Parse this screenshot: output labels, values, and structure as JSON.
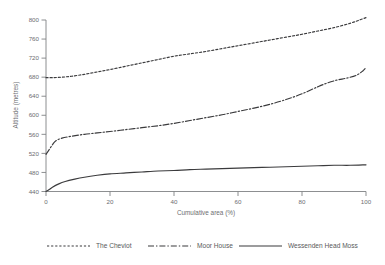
{
  "chart_data": {
    "type": "line",
    "title": "",
    "xlabel": "Cumulative area (%)",
    "ylabel": "Altitude (metres)",
    "xlim": [
      0,
      100
    ],
    "ylim": [
      440,
      800
    ],
    "xticks": [
      0,
      20,
      40,
      60,
      80,
      100
    ],
    "yticks": [
      440,
      480,
      520,
      560,
      600,
      640,
      680,
      720,
      760,
      800
    ],
    "grid": false,
    "legend_position": "below",
    "series": [
      {
        "name": "The Cheviot",
        "style": "dotted",
        "x": [
          0,
          2,
          5,
          8,
          12,
          16,
          20,
          25,
          30,
          35,
          40,
          45,
          50,
          55,
          60,
          65,
          70,
          75,
          80,
          85,
          90,
          95,
          98,
          100
        ],
        "values": [
          679,
          679,
          680,
          682,
          686,
          691,
          696,
          703,
          710,
          717,
          724,
          729,
          734,
          740,
          746,
          752,
          758,
          764,
          770,
          777,
          784,
          793,
          800,
          805
        ]
      },
      {
        "name": "Moor House",
        "style": "dash-dot",
        "x": [
          0,
          1,
          2,
          3,
          5,
          8,
          12,
          16,
          20,
          25,
          30,
          35,
          40,
          45,
          50,
          55,
          60,
          65,
          70,
          75,
          80,
          85,
          88,
          91,
          94,
          97,
          99,
          100
        ],
        "values": [
          518,
          528,
          538,
          546,
          552,
          556,
          560,
          563,
          566,
          570,
          574,
          578,
          583,
          589,
          595,
          601,
          608,
          615,
          623,
          633,
          645,
          660,
          668,
          674,
          678,
          684,
          693,
          700
        ]
      },
      {
        "name": "Wessenden Head Moss",
        "style": "solid",
        "x": [
          0,
          1,
          2,
          4,
          6,
          9,
          12,
          16,
          20,
          25,
          30,
          35,
          40,
          45,
          50,
          55,
          60,
          65,
          70,
          75,
          80,
          85,
          90,
          95,
          100
        ],
        "values": [
          440,
          444,
          449,
          456,
          461,
          466,
          470,
          474,
          477,
          479,
          481,
          483,
          484,
          486,
          487,
          488,
          489,
          490,
          491,
          492,
          493,
          494,
          495,
          495,
          496
        ]
      }
    ]
  },
  "axes": {
    "y_title": "Altitude (metres)",
    "x_title": "Cumulative area (%)",
    "y_tick_labels": [
      "800",
      "760",
      "720",
      "680",
      "640",
      "600",
      "560",
      "520",
      "480",
      "440"
    ],
    "x_tick_labels": [
      "0",
      "20",
      "40",
      "60",
      "80",
      "100"
    ]
  },
  "legend": {
    "items": [
      {
        "label": "The Cheviot",
        "style": "dotted"
      },
      {
        "label": "Moor House",
        "style": "dash-dot"
      },
      {
        "label": "Wessenden Head Moss",
        "style": "solid"
      }
    ]
  },
  "colors": {
    "axis": "#808285",
    "line": "#3b3b3d",
    "text": "#58595b",
    "background": "#ffffff"
  }
}
